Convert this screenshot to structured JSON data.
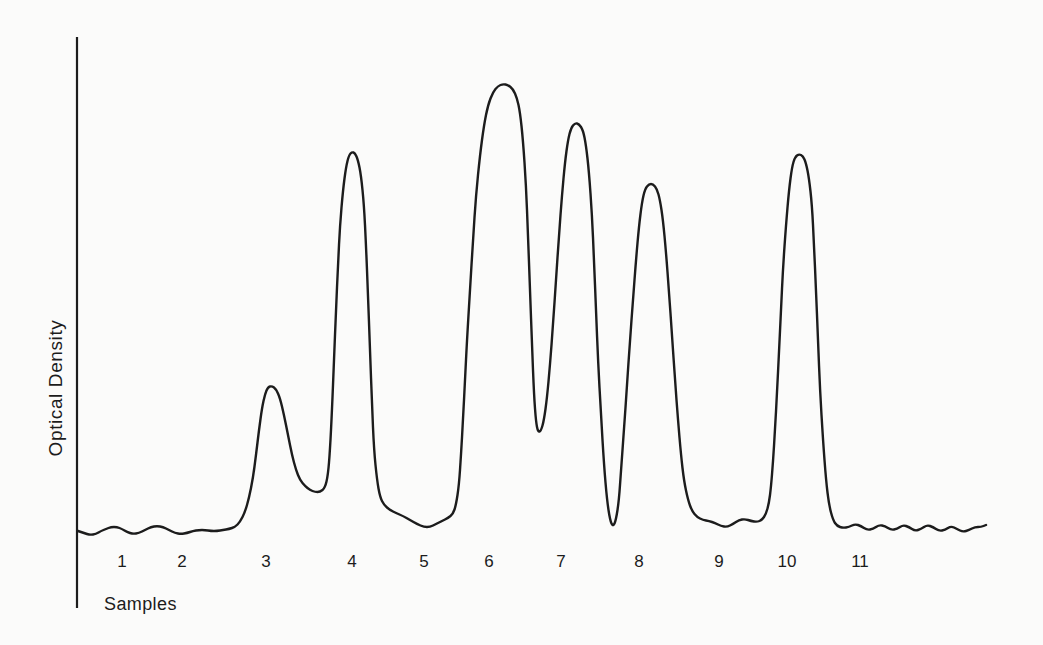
{
  "colors": {
    "ink": "#1c1c1c",
    "background": "#fbfbfa"
  },
  "chart_data": {
    "type": "line",
    "title": "",
    "xlabel": "Samples",
    "ylabel": "Optical Density",
    "x_tick_labels": [
      "1",
      "2",
      "3",
      "4",
      "5",
      "6",
      "7",
      "8",
      "9",
      "10",
      "11"
    ],
    "y_tick_labels": [],
    "grid": false,
    "legend": "none",
    "series": [
      {
        "name": "optical-density-trace",
        "peaks": [
          {
            "sample": 3,
            "relative_height": 0.32
          },
          {
            "sample": 4,
            "relative_height": 0.85
          },
          {
            "sample": 6,
            "relative_height": 1.0
          },
          {
            "sample": 7,
            "relative_height": 0.91
          },
          {
            "sample": 8,
            "relative_height": 0.78
          },
          {
            "sample": 10,
            "relative_height": 0.84
          }
        ],
        "baseline_samples": [
          1,
          2,
          5,
          9,
          11
        ]
      }
    ],
    "axis_px": {
      "x": 77,
      "y_top": 37,
      "y_bottom": 608
    },
    "x_ticks_px": [
      {
        "label": "1",
        "x": 122
      },
      {
        "label": "2",
        "x": 182
      },
      {
        "label": "3",
        "x": 266
      },
      {
        "label": "4",
        "x": 352
      },
      {
        "label": "5",
        "x": 424
      },
      {
        "label": "6",
        "x": 489
      },
      {
        "label": "7",
        "x": 561
      },
      {
        "label": "8",
        "x": 639
      },
      {
        "label": "9",
        "x": 719
      },
      {
        "label": "10",
        "x": 787
      },
      {
        "label": "11",
        "x": 860
      }
    ],
    "trace_px": [
      [
        78,
        531
      ],
      [
        84,
        533
      ],
      [
        90,
        535
      ],
      [
        96,
        534
      ],
      [
        101,
        531
      ],
      [
        106,
        529
      ],
      [
        111,
        527
      ],
      [
        117,
        527
      ],
      [
        122,
        529
      ],
      [
        127,
        532
      ],
      [
        133,
        534
      ],
      [
        139,
        533
      ],
      [
        145,
        530
      ],
      [
        151,
        527
      ],
      [
        157,
        526
      ],
      [
        163,
        527
      ],
      [
        169,
        530
      ],
      [
        175,
        533
      ],
      [
        181,
        534
      ],
      [
        187,
        533
      ],
      [
        193,
        531
      ],
      [
        199,
        530
      ],
      [
        205,
        530
      ],
      [
        211,
        531
      ],
      [
        217,
        531
      ],
      [
        223,
        530
      ],
      [
        229,
        529
      ],
      [
        235,
        527
      ],
      [
        240,
        522
      ],
      [
        245,
        512
      ],
      [
        249,
        498
      ],
      [
        253,
        478
      ],
      [
        256,
        455
      ],
      [
        259,
        430
      ],
      [
        262,
        408
      ],
      [
        265,
        394
      ],
      [
        268,
        387
      ],
      [
        272,
        386
      ],
      [
        276,
        389
      ],
      [
        280,
        398
      ],
      [
        284,
        415
      ],
      [
        288,
        435
      ],
      [
        292,
        455
      ],
      [
        296,
        470
      ],
      [
        300,
        480
      ],
      [
        305,
        486
      ],
      [
        310,
        490
      ],
      [
        315,
        492
      ],
      [
        320,
        492
      ],
      [
        325,
        488
      ],
      [
        328,
        475
      ],
      [
        330,
        450
      ],
      [
        332,
        410
      ],
      [
        334,
        360
      ],
      [
        336,
        310
      ],
      [
        338,
        265
      ],
      [
        340,
        225
      ],
      [
        343,
        190
      ],
      [
        346,
        167
      ],
      [
        349,
        155
      ],
      [
        352,
        152
      ],
      [
        355,
        153
      ],
      [
        358,
        160
      ],
      [
        361,
        175
      ],
      [
        364,
        205
      ],
      [
        366,
        245
      ],
      [
        368,
        295
      ],
      [
        370,
        350
      ],
      [
        372,
        405
      ],
      [
        374,
        450
      ],
      [
        377,
        480
      ],
      [
        380,
        497
      ],
      [
        384,
        505
      ],
      [
        390,
        510
      ],
      [
        396,
        513
      ],
      [
        403,
        516
      ],
      [
        410,
        520
      ],
      [
        417,
        524
      ],
      [
        424,
        527
      ],
      [
        430,
        527
      ],
      [
        436,
        524
      ],
      [
        442,
        521
      ],
      [
        448,
        518
      ],
      [
        453,
        514
      ],
      [
        456,
        505
      ],
      [
        459,
        485
      ],
      [
        461,
        455
      ],
      [
        463,
        420
      ],
      [
        465,
        380
      ],
      [
        467,
        340
      ],
      [
        470,
        290
      ],
      [
        473,
        240
      ],
      [
        476,
        195
      ],
      [
        480,
        155
      ],
      [
        484,
        125
      ],
      [
        488,
        105
      ],
      [
        493,
        92
      ],
      [
        498,
        86
      ],
      [
        503,
        84
      ],
      [
        508,
        85
      ],
      [
        513,
        89
      ],
      [
        517,
        98
      ],
      [
        520,
        112
      ],
      [
        523,
        140
      ],
      [
        526,
        185
      ],
      [
        528,
        235
      ],
      [
        530,
        290
      ],
      [
        532,
        345
      ],
      [
        534,
        395
      ],
      [
        536,
        422
      ],
      [
        538,
        432
      ],
      [
        541,
        431
      ],
      [
        544,
        420
      ],
      [
        547,
        398
      ],
      [
        550,
        365
      ],
      [
        553,
        325
      ],
      [
        556,
        280
      ],
      [
        559,
        235
      ],
      [
        562,
        195
      ],
      [
        565,
        162
      ],
      [
        568,
        140
      ],
      [
        571,
        128
      ],
      [
        575,
        123
      ],
      [
        579,
        124
      ],
      [
        583,
        130
      ],
      [
        586,
        145
      ],
      [
        589,
        172
      ],
      [
        592,
        215
      ],
      [
        594,
        260
      ],
      [
        596,
        310
      ],
      [
        598,
        360
      ],
      [
        601,
        415
      ],
      [
        604,
        465
      ],
      [
        607,
        500
      ],
      [
        610,
        520
      ],
      [
        613,
        527
      ],
      [
        616,
        520
      ],
      [
        619,
        500
      ],
      [
        621,
        470
      ],
      [
        624,
        430
      ],
      [
        627,
        385
      ],
      [
        630,
        340
      ],
      [
        633,
        300
      ],
      [
        636,
        260
      ],
      [
        639,
        226
      ],
      [
        642,
        202
      ],
      [
        645,
        189
      ],
      [
        649,
        184
      ],
      [
        653,
        184
      ],
      [
        657,
        189
      ],
      [
        660,
        200
      ],
      [
        663,
        220
      ],
      [
        666,
        252
      ],
      [
        669,
        292
      ],
      [
        672,
        335
      ],
      [
        675,
        380
      ],
      [
        678,
        420
      ],
      [
        681,
        455
      ],
      [
        684,
        481
      ],
      [
        688,
        500
      ],
      [
        692,
        511
      ],
      [
        697,
        517
      ],
      [
        703,
        520
      ],
      [
        709,
        521
      ],
      [
        715,
        523
      ],
      [
        721,
        526
      ],
      [
        727,
        527
      ],
      [
        733,
        524
      ],
      [
        739,
        520
      ],
      [
        745,
        519
      ],
      [
        751,
        521
      ],
      [
        757,
        522
      ],
      [
        762,
        520
      ],
      [
        766,
        514
      ],
      [
        769,
        503
      ],
      [
        771,
        487
      ],
      [
        773,
        462
      ],
      [
        775,
        430
      ],
      [
        777,
        393
      ],
      [
        779,
        352
      ],
      [
        781,
        310
      ],
      [
        783,
        268
      ],
      [
        786,
        225
      ],
      [
        789,
        190
      ],
      [
        792,
        167
      ],
      [
        795,
        157
      ],
      [
        799,
        154
      ],
      [
        803,
        156
      ],
      [
        806,
        163
      ],
      [
        809,
        178
      ],
      [
        812,
        205
      ],
      [
        814,
        245
      ],
      [
        816,
        290
      ],
      [
        818,
        340
      ],
      [
        820,
        390
      ],
      [
        823,
        440
      ],
      [
        826,
        480
      ],
      [
        829,
        505
      ],
      [
        833,
        520
      ],
      [
        837,
        526
      ],
      [
        843,
        528
      ],
      [
        849,
        527
      ],
      [
        855,
        524
      ],
      [
        861,
        526
      ],
      [
        867,
        530
      ],
      [
        873,
        529
      ],
      [
        879,
        525
      ],
      [
        885,
        526
      ],
      [
        891,
        530
      ],
      [
        897,
        529
      ],
      [
        903,
        525
      ],
      [
        909,
        527
      ],
      [
        915,
        531
      ],
      [
        921,
        529
      ],
      [
        927,
        525
      ],
      [
        933,
        527
      ],
      [
        939,
        531
      ],
      [
        945,
        530
      ],
      [
        951,
        526
      ],
      [
        957,
        529
      ],
      [
        963,
        532
      ],
      [
        969,
        530
      ],
      [
        975,
        527
      ],
      [
        981,
        527
      ],
      [
        986,
        525
      ]
    ]
  }
}
